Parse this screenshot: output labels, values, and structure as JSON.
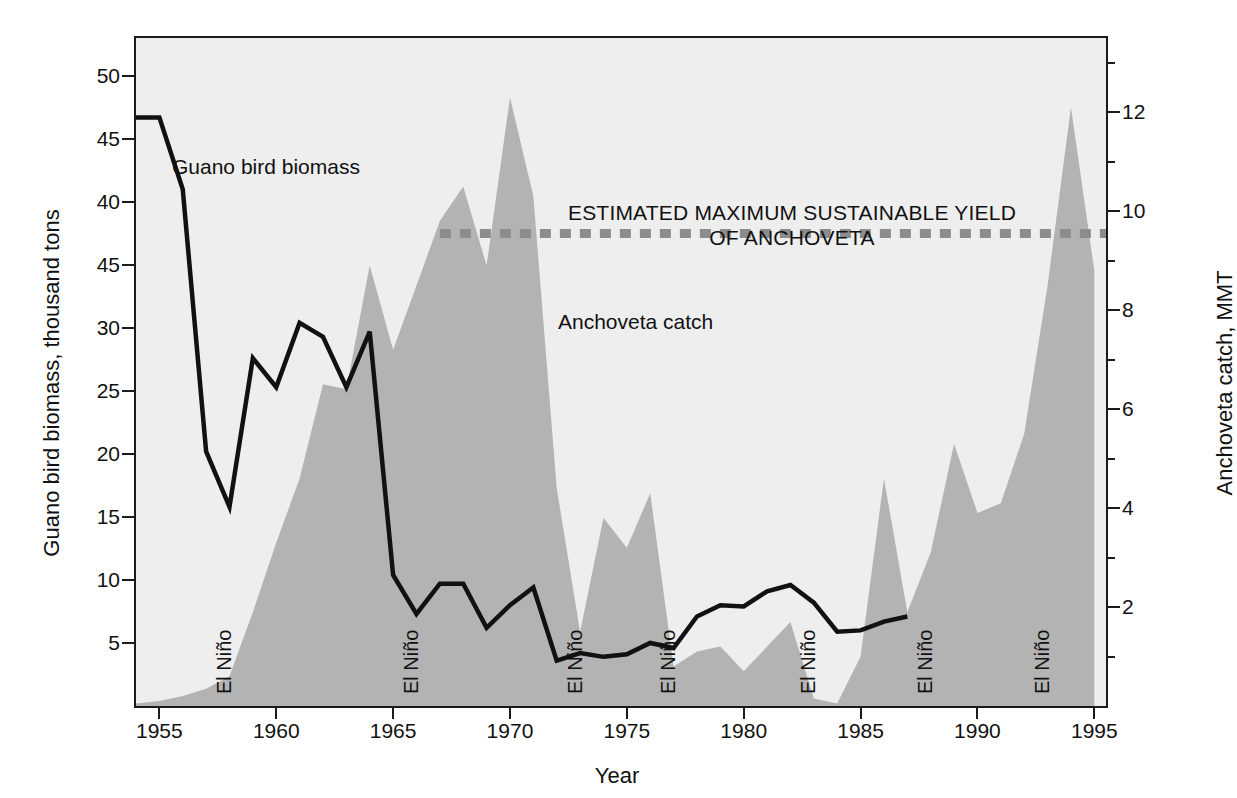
{
  "figure": {
    "background_color": "#ffffff",
    "plot_background_color": "#eeeeee",
    "area_fill_color": "#b3b3b3",
    "line_color": "#111111",
    "emsy_color": "#8c8c8c"
  },
  "axes": {
    "x": {
      "title": "Year",
      "ticks": [
        "1955",
        "1960",
        "1965",
        "1970",
        "1975",
        "1980",
        "1985",
        "1990",
        "1995"
      ],
      "range": [
        1954,
        1995.5
      ]
    },
    "y_left": {
      "title": "Guano bird biomass, thousand tons",
      "ticks": [
        "50",
        "45",
        "40",
        "45",
        "30",
        "25",
        "20",
        "15",
        "10",
        "5"
      ],
      "tick_values": [
        50,
        45,
        40,
        35,
        30,
        25,
        20,
        15,
        10,
        5
      ],
      "range": [
        0,
        53
      ]
    },
    "y_right": {
      "title": "Anchoveta catch, MMT",
      "ticks": [
        "2",
        "4",
        "6",
        "8",
        "10",
        "12"
      ],
      "tick_values": [
        2,
        4,
        6,
        8,
        10,
        12
      ],
      "range": [
        0,
        13.5
      ]
    }
  },
  "annotations": {
    "guano_label": "Guano bird biomass",
    "anchoveta_label": "Anchoveta catch",
    "emsy_label_line1": "ESTIMATED MAXIMUM SUSTAINABLE YIELD",
    "emsy_label_line2": "OF ANCHOVETA",
    "el_nino_label": "El Niño",
    "el_nino_years": [
      1957,
      1965,
      1972,
      1976,
      1982,
      1987,
      1992
    ]
  },
  "chart_data": {
    "type": "area",
    "title": "",
    "xlabel": "Year",
    "ylabel": "Guano bird biomass, thousand tons",
    "ylabel_right": "Anchoveta catch, MMT",
    "xlim": [
      1954,
      1995.5
    ],
    "ylim_left": [
      0,
      53
    ],
    "ylim_right": [
      0,
      13.5
    ],
    "grid": false,
    "legend": "inline-annotations",
    "series": [
      {
        "name": "Anchoveta catch",
        "type": "area",
        "axis": "right",
        "units": "MMT",
        "color": "#b3b3b3",
        "x": [
          1954,
          1955,
          1956,
          1957,
          1958,
          1959,
          1960,
          1961,
          1962,
          1963,
          1964,
          1965,
          1966,
          1967,
          1968,
          1969,
          1970,
          1971,
          1972,
          1973,
          1974,
          1975,
          1976,
          1977,
          1978,
          1979,
          1980,
          1981,
          1982,
          1983,
          1984,
          1985,
          1986,
          1987,
          1988,
          1989,
          1990,
          1991,
          1992,
          1993,
          1994,
          1995
        ],
        "values": [
          0.05,
          0.1,
          0.2,
          0.35,
          0.6,
          1.9,
          3.3,
          4.6,
          6.5,
          6.4,
          8.9,
          7.2,
          8.5,
          9.8,
          10.5,
          8.9,
          12.3,
          10.3,
          4.4,
          1.5,
          3.8,
          3.2,
          4.3,
          0.8,
          1.1,
          1.2,
          0.7,
          1.2,
          1.7,
          0.15,
          0.05,
          1.0,
          4.6,
          1.9,
          3.1,
          5.3,
          3.9,
          4.1,
          5.5,
          8.5,
          12.1,
          8.8
        ]
      },
      {
        "name": "Guano bird biomass",
        "type": "line",
        "axis": "left",
        "units": "thousand tons",
        "color": "#111111",
        "x": [
          1954,
          1955,
          1956,
          1957,
          1958,
          1959,
          1960,
          1961,
          1962,
          1963,
          1964,
          1965,
          1966,
          1967,
          1968,
          1969,
          1970,
          1971,
          1972,
          1973,
          1974,
          1975,
          1976,
          1977,
          1978,
          1979,
          1980,
          1981,
          1982,
          1983,
          1984,
          1985,
          1986,
          1987
        ],
        "values": [
          46.7,
          46.7,
          41.0,
          20.2,
          15.8,
          27.6,
          25.3,
          30.4,
          29.3,
          25.3,
          29.7,
          10.4,
          7.3,
          9.7,
          9.7,
          6.2,
          8.0,
          9.4,
          3.6,
          4.2,
          3.9,
          4.1,
          5.0,
          4.6,
          7.1,
          8.0,
          7.9,
          9.1,
          9.6,
          8.2,
          5.9,
          6.0,
          6.7,
          7.1
        ]
      },
      {
        "name": "Estimated maximum sustainable yield of anchoveta",
        "type": "hline",
        "axis": "right",
        "units": "MMT",
        "color": "#8c8c8c",
        "style": "dashed",
        "value": 9.55,
        "x_start": 1967.0,
        "x_end": 1995.5
      }
    ]
  }
}
